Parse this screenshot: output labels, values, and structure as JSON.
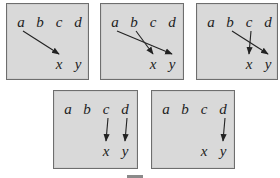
{
  "diagram": {
    "top_labels": [
      "a",
      "b",
      "c",
      "d"
    ],
    "bottom_labels": [
      "x",
      "y"
    ],
    "colors": {
      "panel_bg": "#d9d9d9",
      "panel_border": "#6e6e6e",
      "arrow": "#222222",
      "text": "#222222"
    },
    "panels": [
      {
        "id": "panel-1",
        "arrows": [
          {
            "from": "a",
            "to": "x"
          }
        ]
      },
      {
        "id": "panel-2",
        "arrows": [
          {
            "from": "a",
            "to": "y"
          },
          {
            "from": "b",
            "to": "x"
          }
        ]
      },
      {
        "id": "panel-3",
        "arrows": [
          {
            "from": "b",
            "to": "y"
          },
          {
            "from": "c",
            "to": "x"
          }
        ]
      },
      {
        "id": "panel-4",
        "arrows": [
          {
            "from": "c",
            "to": "x"
          },
          {
            "from": "d",
            "to": "y"
          }
        ]
      },
      {
        "id": "panel-5",
        "arrows": [
          {
            "from": "d",
            "to": "y"
          }
        ]
      }
    ]
  },
  "labels": {
    "a": "a",
    "b": "b",
    "c": "c",
    "d": "d",
    "x": "x",
    "y": "y"
  }
}
